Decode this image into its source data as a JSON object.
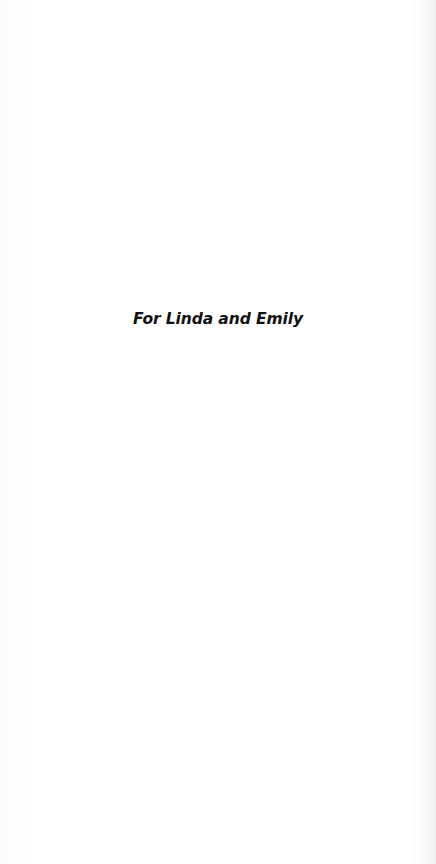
{
  "page": {
    "type": "dedication",
    "dedication_text": "For Linda and Emily"
  }
}
